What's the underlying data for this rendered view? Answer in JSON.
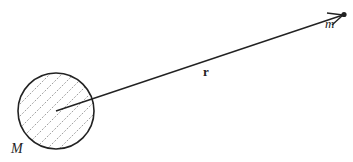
{
  "diagram": {
    "mass_body": {
      "label": "M",
      "shape": "hatched-circle",
      "center": [
        56,
        111
      ],
      "radius": 38
    },
    "test_mass": {
      "label": "m",
      "position": [
        344,
        15
      ]
    },
    "vector": {
      "label": "r",
      "from": [
        56,
        111
      ],
      "to": [
        344,
        15
      ]
    },
    "colors": {
      "stroke": "#222222",
      "hatch": "#888888",
      "background": "#ffffff"
    }
  }
}
